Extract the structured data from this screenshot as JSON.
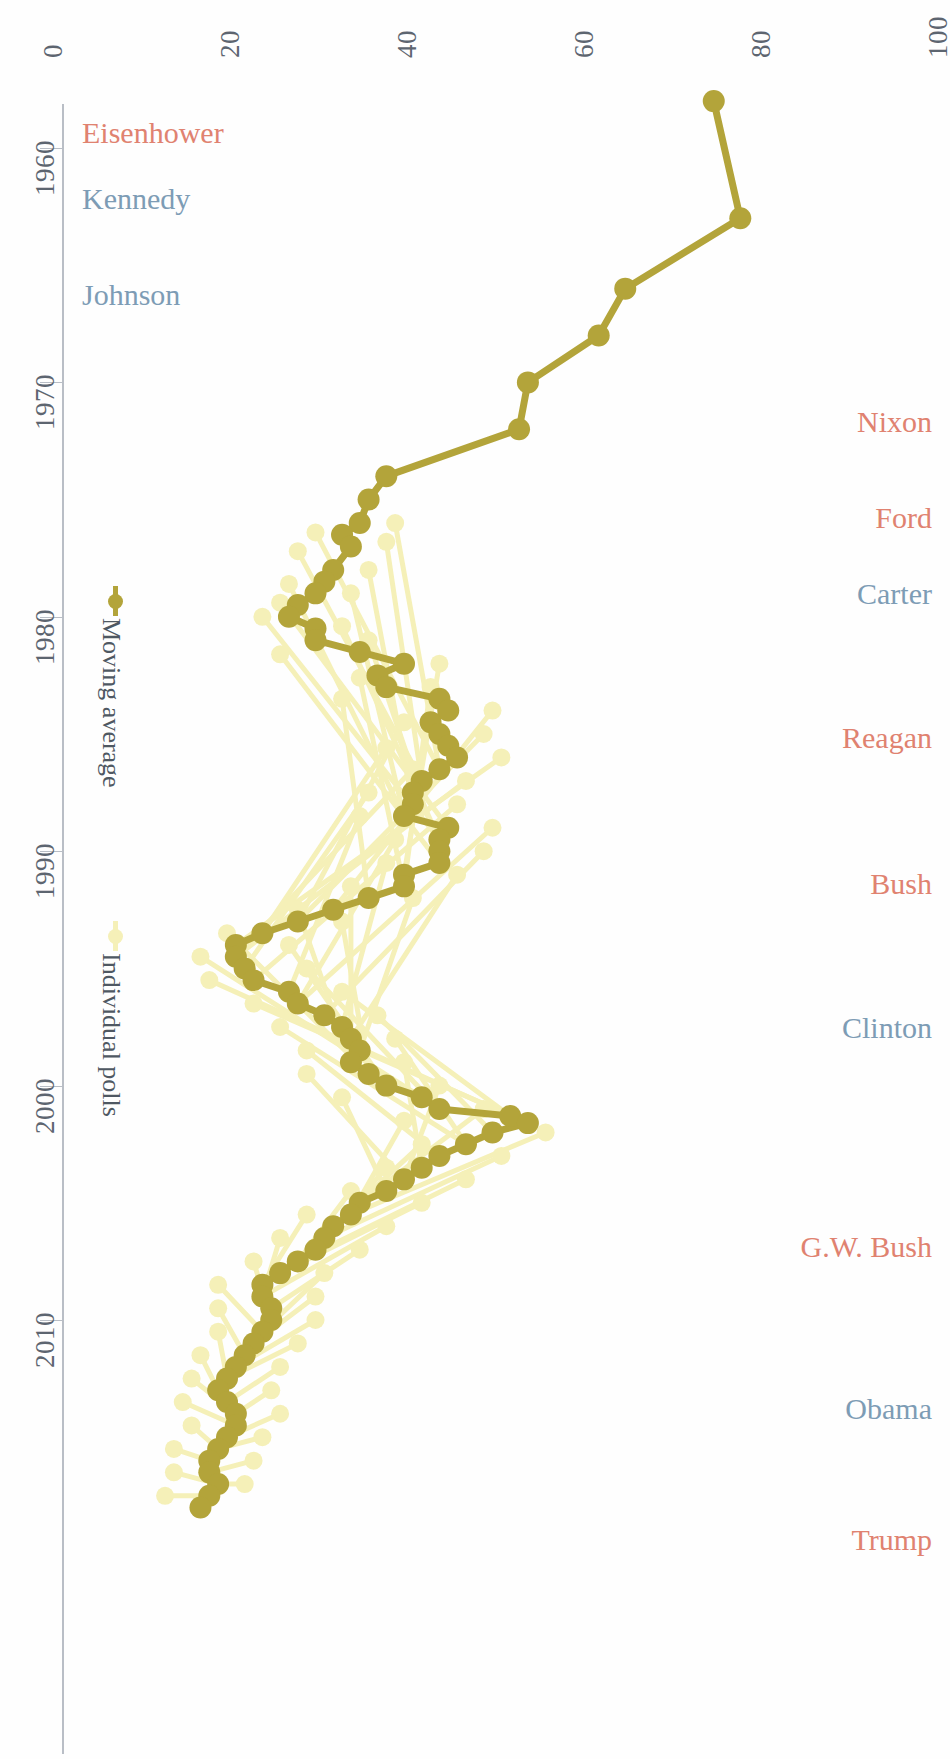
{
  "axes": {
    "value_axis": {
      "position": "top",
      "orientation": "horizontal",
      "ticks": [
        "0",
        "20",
        "40",
        "60",
        "80",
        "100"
      ],
      "tick_values": [
        0,
        20,
        40,
        60,
        80,
        100
      ],
      "range": [
        0,
        100
      ]
    },
    "year_axis": {
      "position": "left",
      "orientation": "vertical",
      "ticks": [
        "1960",
        "1970",
        "1980",
        "1990",
        "2000",
        "2010"
      ],
      "tick_values": [
        1960,
        1970,
        1980,
        1990,
        2000,
        2010
      ],
      "range": [
        1958,
        2018
      ]
    }
  },
  "legend": {
    "position": "left-inside",
    "items": [
      {
        "label": "Moving average",
        "color": "#b3a43a",
        "marker": "circle-with-bar"
      },
      {
        "label": "Individual polls",
        "color": "#f5f0b8",
        "marker": "circle-with-bar"
      }
    ]
  },
  "presidents": [
    {
      "name": "Eisenhower",
      "party": "R",
      "color": "#e08270",
      "side": "left",
      "y": 116
    },
    {
      "name": "Kennedy",
      "party": "D",
      "color": "#7d9cb5",
      "side": "left",
      "y": 182
    },
    {
      "name": "Johnson",
      "party": "D",
      "color": "#7d9cb5",
      "side": "left",
      "y": 278
    },
    {
      "name": "Nixon",
      "party": "R",
      "color": "#e08270",
      "side": "right",
      "y": 405
    },
    {
      "name": "Ford",
      "party": "R",
      "color": "#e08270",
      "side": "right",
      "y": 501
    },
    {
      "name": "Carter",
      "party": "D",
      "color": "#7d9cb5",
      "side": "right",
      "y": 577
    },
    {
      "name": "Reagan",
      "party": "R",
      "color": "#e08270",
      "side": "right",
      "y": 721
    },
    {
      "name": "Bush",
      "party": "R",
      "color": "#e08270",
      "side": "right",
      "y": 867
    },
    {
      "name": "Clinton",
      "party": "D",
      "color": "#7d9cb5",
      "side": "right",
      "y": 1011
    },
    {
      "name": "G.W. Bush",
      "party": "R",
      "color": "#e08270",
      "side": "right",
      "y": 1230
    },
    {
      "name": "Obama",
      "party": "D",
      "color": "#7d9cb5",
      "side": "right",
      "y": 1392
    },
    {
      "name": "Trump",
      "party": "R",
      "color": "#e08270",
      "side": "right",
      "y": 1523
    }
  ],
  "colors": {
    "moving_average": "#b3a43a",
    "individual_polls": "#f5f0b8",
    "axis": "#b9bec6",
    "axis_text": "#5d6570",
    "republican": "#e08270",
    "democrat": "#7d9cb5",
    "background": "#fefefe"
  },
  "chart_data": {
    "type": "line",
    "title": "",
    "subtitle": "",
    "xlabel": "",
    "ylabel": "",
    "orientation": "rotated-90",
    "xlim": [
      1958,
      2018
    ],
    "ylim": [
      0,
      100
    ],
    "grid": false,
    "legend_position": "left-inside",
    "series": [
      {
        "name": "Moving average",
        "color": "#b3a43a",
        "x": [
          1958,
          1963,
          1966,
          1968,
          1970,
          1972,
          1974,
          1975,
          1976,
          1976.5,
          1977,
          1978,
          1978.5,
          1979,
          1979.5,
          1980,
          1980.5,
          1981,
          1981.5,
          1982,
          1982.5,
          1983,
          1983.5,
          1984,
          1984.5,
          1985,
          1985.5,
          1986,
          1986.5,
          1987,
          1987.5,
          1988,
          1988.5,
          1989,
          1989.5,
          1990,
          1990.5,
          1991,
          1991.5,
          1992,
          1992.5,
          1993,
          1993.5,
          1994,
          1994.5,
          1995,
          1995.5,
          1996,
          1996.5,
          1997,
          1997.5,
          1998,
          1998.5,
          1999,
          1999.5,
          2000,
          2000.5,
          2001,
          2001.3,
          2001.6,
          2002,
          2002.5,
          2003,
          2003.5,
          2004,
          2004.5,
          2005,
          2005.5,
          2006,
          2006.5,
          2007,
          2007.5,
          2008,
          2008.5,
          2009,
          2009.5,
          2010,
          2010.5,
          2011,
          2011.5,
          2012,
          2012.5,
          2013,
          2013.5,
          2014,
          2014.5,
          2015,
          2015.5,
          2016,
          2016.5,
          2017,
          2017.5,
          2018
        ],
        "y": [
          75,
          78,
          65,
          62,
          54,
          53,
          38,
          36,
          35,
          33,
          34,
          32,
          31,
          30,
          28,
          27,
          30,
          30,
          35,
          40,
          37,
          38,
          44,
          45,
          43,
          44,
          45,
          46,
          44,
          42,
          41,
          41,
          40,
          45,
          44,
          44,
          44,
          40,
          40,
          36,
          32,
          28,
          24,
          21,
          21,
          22,
          23,
          27,
          28,
          31,
          33,
          34,
          35,
          34,
          36,
          38,
          42,
          44,
          52,
          54,
          50,
          47,
          44,
          42,
          40,
          38,
          35,
          34,
          32,
          31,
          30,
          28,
          26,
          24,
          24,
          25,
          25,
          24,
          23,
          22,
          21,
          20,
          19,
          20,
          21,
          21,
          20,
          19,
          18,
          18,
          19,
          18,
          17
        ],
        "note": "Moving average of trust-in-government style polling, percent"
      },
      {
        "name": "Individual polls",
        "color": "#f5f0b8",
        "note": "Scatter of individual poll results around the moving average, percent",
        "x": [
          1976,
          1976.4,
          1976.8,
          1977.2,
          1978,
          1978.6,
          1979,
          1979.4,
          1980,
          1980.4,
          1981,
          1981.6,
          1982,
          1982.6,
          1983,
          1983.5,
          1984,
          1984.5,
          1985,
          1985.6,
          1986,
          1986.5,
          1987,
          1987.5,
          1988,
          1988.5,
          1989,
          1989.5,
          1990,
          1990.5,
          1991,
          1991.5,
          1992,
          1992.5,
          1993,
          1993.5,
          1994,
          1994.5,
          1995,
          1995.5,
          1996,
          1996.5,
          1997,
          1997.5,
          1998,
          1998.5,
          1999,
          1999.5,
          2000,
          2000.5,
          2001,
          2001.5,
          2002,
          2002.5,
          2003,
          2003.5,
          2004,
          2004.5,
          2005,
          2005.5,
          2006,
          2006.5,
          2007,
          2007.5,
          2008,
          2008.5,
          2009,
          2009.5,
          2010,
          2010.5,
          2011,
          2011.5,
          2012,
          2012.5,
          2013,
          2013.5,
          2014,
          2014.5,
          2015,
          2015.5,
          2016,
          2016.5,
          2017,
          2017.5
        ],
        "y": [
          39,
          30,
          38,
          28,
          36,
          27,
          34,
          26,
          24,
          33,
          36,
          26,
          44,
          35,
          43,
          33,
          50,
          40,
          49,
          38,
          51,
          41,
          47,
          36,
          46,
          35,
          50,
          39,
          49,
          38,
          46,
          34,
          41,
          28,
          33,
          20,
          27,
          17,
          29,
          18,
          33,
          23,
          37,
          26,
          39,
          29,
          40,
          29,
          44,
          33,
          49,
          40,
          56,
          42,
          51,
          38,
          47,
          34,
          42,
          29,
          38,
          26,
          35,
          23,
          31,
          19,
          30,
          19,
          30,
          19,
          28,
          17,
          26,
          16,
          25,
          15,
          26,
          16,
          24,
          14,
          23,
          14,
          22,
          13
        ]
      }
    ]
  }
}
